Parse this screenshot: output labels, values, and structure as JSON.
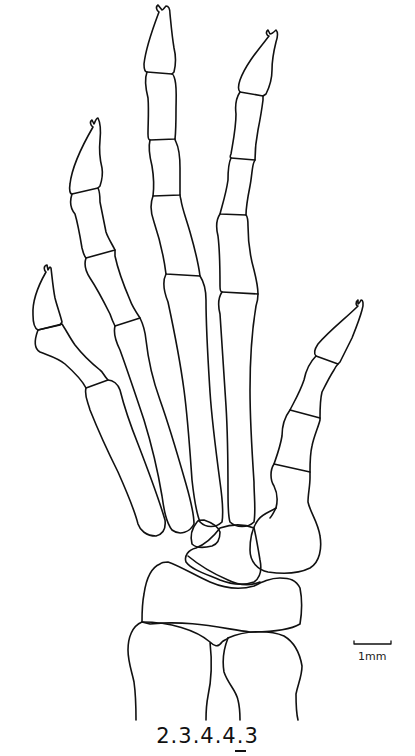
{
  "figure": {
    "digits": [
      {
        "name": "digit-1",
        "phalanges": 2
      },
      {
        "name": "digit-2",
        "phalanges": 3
      },
      {
        "name": "digit-3",
        "phalanges": 4
      },
      {
        "name": "digit-4",
        "phalanges": 4
      },
      {
        "name": "digit-5",
        "phalanges": 3
      }
    ],
    "line_color": "#111111",
    "background": "#ffffff"
  },
  "scale_bar": {
    "label": "1mm"
  },
  "caption": {
    "text": "2.3.4.4.3",
    "underlined_digit_index": 3
  }
}
